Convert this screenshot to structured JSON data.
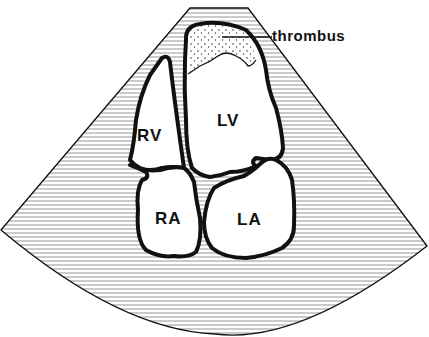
{
  "diagram": {
    "type": "echocardiogram-apical-four-chamber-schematic",
    "chambers": [
      {
        "id": "rv",
        "label": "RV"
      },
      {
        "id": "lv",
        "label": "LV"
      },
      {
        "id": "ra",
        "label": "RA"
      },
      {
        "id": "la",
        "label": "LA"
      }
    ],
    "annotation": {
      "label": "thrombus",
      "target": "lv-apex"
    },
    "colors": {
      "outline": "#111111",
      "hatch": "#8a8a8a",
      "background": "#ffffff"
    }
  }
}
